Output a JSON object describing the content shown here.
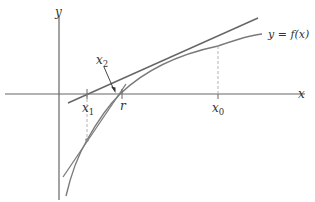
{
  "diagram": {
    "axes": {
      "x_label": "x",
      "y_label": "y"
    },
    "curve_label": "y = f(x)",
    "points": {
      "x0": {
        "label": "x",
        "sub": "0"
      },
      "x1": {
        "label": "x",
        "sub": "1"
      },
      "x2": {
        "label": "x",
        "sub": "2"
      },
      "r": {
        "label": "r"
      }
    },
    "colors": {
      "curve": "#7a7a7a",
      "tangent": "#666666",
      "axis": "#666666",
      "dashed": "#aaaaaa",
      "text": "#333333"
    }
  }
}
